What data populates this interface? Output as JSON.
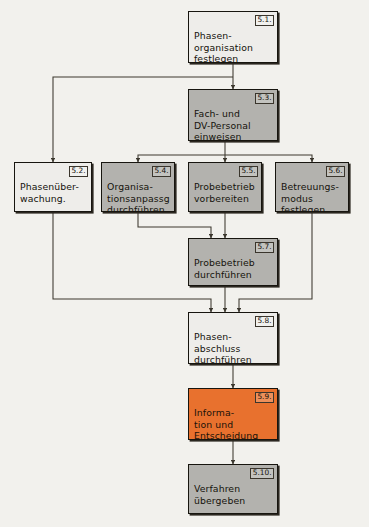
{
  "diagram": {
    "background_color": "#f2f1ed",
    "line_color": "#3c382f",
    "colors": {
      "light": "#eeedea",
      "gray": "#b3b2ae",
      "orange": "#e8712e",
      "border": "#17150f"
    },
    "nodes": [
      {
        "id": "n51",
        "number": "5.1.",
        "label": "Phasen-\norganisation\nfestlegen",
        "fill": "light",
        "x": 188,
        "y": 11,
        "w": 90,
        "h": 52
      },
      {
        "id": "n53",
        "number": "5.3.",
        "label": "Fach- und\nDV-Personal\neinweisen",
        "fill": "gray",
        "x": 188,
        "y": 89,
        "w": 90,
        "h": 52
      },
      {
        "id": "n52",
        "number": "5.2.",
        "label": "Phasenüber-\nwachung.",
        "fill": "light",
        "x": 14,
        "y": 162,
        "w": 78,
        "h": 50
      },
      {
        "id": "n54",
        "number": "5.4.",
        "label": "Organisa-\ntionsanpassg\ndurchführen",
        "fill": "gray",
        "x": 101,
        "y": 162,
        "w": 74,
        "h": 50
      },
      {
        "id": "n55",
        "number": "5.5.",
        "label": "Probebetrieb\nvorbereiten",
        "fill": "gray",
        "x": 188,
        "y": 162,
        "w": 74,
        "h": 50
      },
      {
        "id": "n56",
        "number": "5.6.",
        "label": "Betreuungs-\nmodus\nfestlegen",
        "fill": "gray",
        "x": 275,
        "y": 162,
        "w": 74,
        "h": 50
      },
      {
        "id": "n57",
        "number": "5.7.",
        "label": "Probebetrieb\ndurchführen",
        "fill": "gray",
        "x": 188,
        "y": 238,
        "w": 90,
        "h": 48
      },
      {
        "id": "n58",
        "number": "5.8.",
        "label": "Phasen-\nabschluss\ndurchführen",
        "fill": "light",
        "x": 188,
        "y": 312,
        "w": 90,
        "h": 52
      },
      {
        "id": "n59",
        "number": "5.9.",
        "label": "Informa-\ntion und\nEntscheidung",
        "fill": "orange",
        "x": 188,
        "y": 388,
        "w": 90,
        "h": 52
      },
      {
        "id": "n510",
        "number": "5.10.",
        "label": "Verfahren\nübergeben",
        "fill": "gray",
        "x": 188,
        "y": 464,
        "w": 90,
        "h": 50
      }
    ],
    "edges": [
      {
        "name": "edge-51-to-53",
        "from": "5.1.",
        "to": "5.3.",
        "path": "M233,63 L233,89"
      },
      {
        "name": "edge-51-to-52",
        "from": "5.1.",
        "to": "5.2.",
        "path": "M233,77 L53,77 L53,162"
      },
      {
        "name": "edge-53-to-55",
        "from": "5.3.",
        "to": "5.5.",
        "path": "M225,141 L225,162"
      },
      {
        "name": "edge-53-to-54",
        "from": "5.3.",
        "to": "5.4.",
        "path": "M225,155 L138,155 L138,162"
      },
      {
        "name": "edge-53-to-56",
        "from": "5.3.",
        "to": "5.6.",
        "path": "M225,155 L312,155 L312,162"
      },
      {
        "name": "edge-55-to-57",
        "from": "5.5.",
        "to": "5.7.",
        "path": "M225,212 L225,238"
      },
      {
        "name": "edge-54-to-57",
        "from": "5.4.",
        "to": "5.7.",
        "path": "M138,212 L138,227 L211,227 L211,238"
      },
      {
        "name": "edge-57-to-58",
        "from": "5.7.",
        "to": "5.8.",
        "path": "M225,286 L225,312"
      },
      {
        "name": "edge-52-to-58",
        "from": "5.2.",
        "to": "5.8.",
        "path": "M53,212 L53,299 L211,299 L211,312"
      },
      {
        "name": "edge-56-to-58",
        "from": "5.6.",
        "to": "5.8.",
        "path": "M312,212 L312,299 L239,299 L239,312"
      },
      {
        "name": "edge-58-to-59",
        "from": "5.8.",
        "to": "5.9.",
        "path": "M233,364 L233,388"
      },
      {
        "name": "edge-59-to-510",
        "from": "5.9.",
        "to": "5.10.",
        "path": "M233,440 L233,464"
      }
    ]
  }
}
